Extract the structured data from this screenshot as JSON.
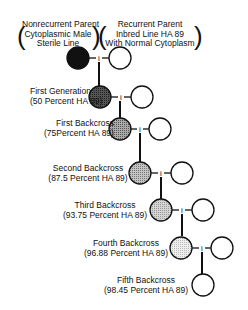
{
  "header": {
    "left": {
      "line1": "Nonrecurrent Parent",
      "line2": "Cytoplasmic Male",
      "line3": "Sterile Line"
    },
    "right": {
      "line1": "Recurrent Parent",
      "line2": "Inbred Line HA 89",
      "line3": "With Normal Cytoplasm"
    }
  },
  "generations": [
    {
      "name": "First Generation",
      "pct": "(50 Percent HA 89)",
      "fill": "#3a3a3a"
    },
    {
      "name": "First Backcross",
      "pct": "(75Percent HA 89)",
      "fill": "#8a8a8a"
    },
    {
      "name": "Second Backcross",
      "pct": "(87.5 Percent HA 89)",
      "fill": "#a8a8a8"
    },
    {
      "name": "Third Backcross",
      "pct": "(93.75 Percent HA 89)",
      "fill": "#c0c0c0"
    },
    {
      "name": "Fourth Backcross",
      "pct": "(96.88 Percent HA 89)",
      "fill": "#e0e0e0"
    },
    {
      "name": "Fifth Backcross",
      "pct": "(98.45 Percent HA 89)",
      "fill": "#ffffff"
    }
  ],
  "colors": {
    "nonrecurrent": "#111111",
    "recurrent": "#ffffff",
    "line": "#111111"
  }
}
